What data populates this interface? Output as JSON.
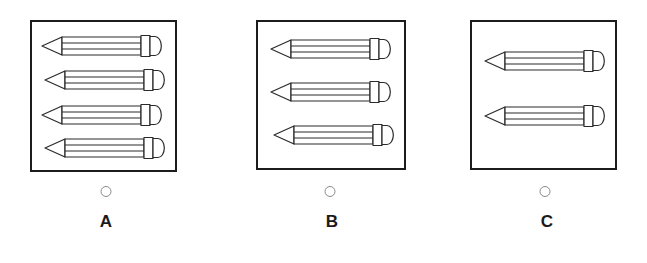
{
  "question": {
    "type": "multiple-choice-image",
    "options": [
      {
        "id": "A",
        "label": "A",
        "pencil_count": 4,
        "radio_name": "radio-option-a",
        "selected": false
      },
      {
        "id": "B",
        "label": "B",
        "pencil_count": 3,
        "radio_name": "radio-option-b",
        "selected": false
      },
      {
        "id": "C",
        "label": "C",
        "pencil_count": 2,
        "radio_name": "radio-option-c",
        "selected": false
      }
    ]
  },
  "colors": {
    "background": "#ffffff",
    "box_border": "#1c1c1c",
    "pencil_outline": "#2b2b2b",
    "pencil_fill": "#ffffff",
    "radio_border": "#8a8a8a",
    "label_text": "#1a1a1a"
  },
  "icons": {
    "pencil": "pencil-icon",
    "radio": "radio-button-icon"
  }
}
